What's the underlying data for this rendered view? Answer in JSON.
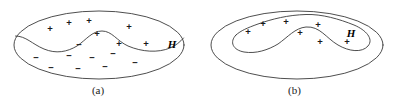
{
  "figure": {
    "stroke_color": "#3a3a3a",
    "marker_color": "#1a1a1a",
    "background_color": "#ffffff"
  },
  "panels": [
    {
      "id": "a",
      "caption": "(a)",
      "hypothesis_label": "H",
      "outer_shape": "ellipse",
      "outer_ellipse": {
        "cx": 99,
        "cy": 45,
        "rx": 85,
        "ry": 34
      },
      "divider_description": "wavy curve splitting ellipse into upper positive region and lower negative region",
      "hypothesis_label_pos": {
        "x": 172,
        "y": 44
      },
      "markers": [
        {
          "symbol": "+",
          "x": 50,
          "y": 28
        },
        {
          "symbol": "+",
          "x": 69,
          "y": 22
        },
        {
          "symbol": "+",
          "x": 89,
          "y": 20
        },
        {
          "symbol": "+",
          "x": 97,
          "y": 33
        },
        {
          "symbol": "+",
          "x": 129,
          "y": 26
        },
        {
          "symbol": "+",
          "x": 119,
          "y": 43
        },
        {
          "symbol": "+",
          "x": 146,
          "y": 43
        },
        {
          "symbol": "−",
          "x": 79,
          "y": 44
        },
        {
          "symbol": "−",
          "x": 36,
          "y": 57
        },
        {
          "symbol": "−",
          "x": 69,
          "y": 55
        },
        {
          "symbol": "−",
          "x": 92,
          "y": 57
        },
        {
          "symbol": "−",
          "x": 113,
          "y": 53
        },
        {
          "symbol": "−",
          "x": 51,
          "y": 67
        },
        {
          "symbol": "−",
          "x": 78,
          "y": 68
        },
        {
          "symbol": "−",
          "x": 105,
          "y": 66
        },
        {
          "symbol": "−",
          "x": 135,
          "y": 62
        }
      ],
      "marker_counts": {
        "positive": 7,
        "negative": 9
      }
    },
    {
      "id": "b",
      "caption": "(b)",
      "hypothesis_label": "H",
      "outer_shape": "ellipse",
      "outer_ellipse": {
        "cx": 101,
        "cy": 45,
        "rx": 86,
        "ry": 34
      },
      "divider_description": "closed curved blob enclosing all positive examples",
      "hypothesis_label_pos": {
        "x": 155,
        "y": 33
      },
      "markers": [
        {
          "symbol": "+",
          "x": 52,
          "y": 31
        },
        {
          "symbol": "+",
          "x": 67,
          "y": 23
        },
        {
          "symbol": "+",
          "x": 90,
          "y": 21
        },
        {
          "symbol": "+",
          "x": 104,
          "y": 32
        },
        {
          "symbol": "+",
          "x": 122,
          "y": 24
        },
        {
          "symbol": "+",
          "x": 124,
          "y": 41
        },
        {
          "symbol": "+",
          "x": 151,
          "y": 41
        }
      ],
      "marker_counts": {
        "positive": 7,
        "negative": 0
      }
    }
  ]
}
